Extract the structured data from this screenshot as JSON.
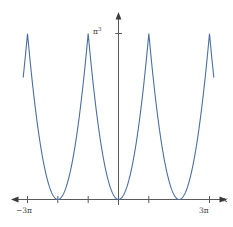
{
  "chart_data": {
    "type": "line",
    "title": "",
    "subtitle": "",
    "xlabel": "x",
    "ylabel": "",
    "xlim": [
      -9.8696,
      9.8696
    ],
    "ylim": [
      0,
      34.5
    ],
    "grid": false,
    "legend": null,
    "x_tick_labels": [
      "−3π",
      "3π"
    ],
    "x_tick_values": [
      -9.4248,
      9.4248
    ],
    "x_tick_marks": [
      -9.4248,
      -6.2832,
      -3.1416,
      3.1416,
      9.4248
    ],
    "y_tick_labels": [
      "π³"
    ],
    "y_tick_values": [
      31.0063
    ],
    "series": [
      {
        "name": "periodic parabola",
        "description": "Periodic even function with parabolic wells touching y=0 at x = -2π, 0, 2π and sharp cusps peaking at y = π³ at x = -3π, -π, π, 3π",
        "color": "#4a6f9e",
        "linewidth": 1.1,
        "minima_x": [
          -6.2832,
          0,
          6.2832
        ],
        "minima_y": [
          0,
          0,
          0
        ],
        "maxima_x": [
          -9.4248,
          -3.1416,
          3.1416,
          9.4248
        ],
        "maxima_y": [
          31.0063,
          31.0063,
          31.0063,
          31.0063
        ]
      }
    ],
    "axis_color": "#5a5a5a",
    "background": "#ffffff"
  },
  "axes": {
    "x_axis_name": "x",
    "y_tick_text": "π",
    "y_tick_exponent": "3",
    "x_tick_left": "−3π",
    "x_tick_right": "3π"
  }
}
